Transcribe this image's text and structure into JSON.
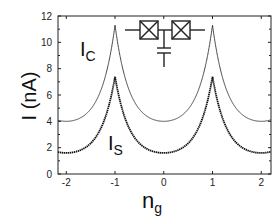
{
  "chart_data": {
    "type": "line",
    "title": "",
    "xlabel": "n",
    "xlabel_sub": "g",
    "ylabel": "I (nA)",
    "xlim": [
      -2.17,
      2.2
    ],
    "ylim": [
      0,
      12
    ],
    "xticks": [
      -2,
      -1,
      0,
      1,
      2
    ],
    "xtick_labels": [
      "-2",
      "-1",
      "0",
      "1",
      "2"
    ],
    "yticks": [
      0,
      2,
      4,
      6,
      8,
      10,
      12
    ],
    "ytick_labels": [
      "0",
      "2",
      "4",
      "6",
      "8",
      "10",
      "12"
    ],
    "grid": false,
    "legend": "none (inline labels)",
    "series": [
      {
        "name": "I_C",
        "label_main": "I",
        "label_sub": "C",
        "style": "solid thin line",
        "period": 2,
        "peak_positions": [
          -1,
          1
        ],
        "peak_value": 11.3,
        "min_positions": [
          -2,
          0,
          2
        ],
        "min_value": 4.0,
        "sample_points": [
          {
            "x": -2.0,
            "y": 4.0
          },
          {
            "x": -1.5,
            "y": 5.0
          },
          {
            "x": -1.25,
            "y": 7.5
          },
          {
            "x": -1.0,
            "y": 11.3
          },
          {
            "x": -0.75,
            "y": 7.5
          },
          {
            "x": -0.5,
            "y": 5.0
          },
          {
            "x": 0.0,
            "y": 4.0
          },
          {
            "x": 0.5,
            "y": 5.0
          },
          {
            "x": 0.75,
            "y": 7.5
          },
          {
            "x": 1.0,
            "y": 11.3
          },
          {
            "x": 1.25,
            "y": 7.5
          },
          {
            "x": 1.5,
            "y": 5.0
          },
          {
            "x": 2.0,
            "y": 4.0
          }
        ]
      },
      {
        "name": "I_S",
        "label_main": "I",
        "label_sub": "S",
        "style": "dotted thick markers",
        "period": 2,
        "peak_positions": [
          -1,
          1
        ],
        "peak_value": 7.4,
        "min_positions": [
          -2,
          0,
          2
        ],
        "min_value": 1.6,
        "sample_points": [
          {
            "x": -2.0,
            "y": 1.6
          },
          {
            "x": -1.5,
            "y": 2.0
          },
          {
            "x": -1.25,
            "y": 3.6
          },
          {
            "x": -1.0,
            "y": 7.4
          },
          {
            "x": -0.75,
            "y": 3.6
          },
          {
            "x": -0.5,
            "y": 2.0
          },
          {
            "x": 0.0,
            "y": 1.6
          },
          {
            "x": 0.5,
            "y": 2.0
          },
          {
            "x": 0.75,
            "y": 3.6
          },
          {
            "x": 1.0,
            "y": 7.4
          },
          {
            "x": 1.25,
            "y": 3.6
          },
          {
            "x": 1.5,
            "y": 2.0
          },
          {
            "x": 2.0,
            "y": 1.6
          }
        ]
      }
    ],
    "annotations": [
      {
        "type": "circuit-inset",
        "description": "two Josephson junctions in series with a gate capacitor to ground"
      }
    ]
  }
}
